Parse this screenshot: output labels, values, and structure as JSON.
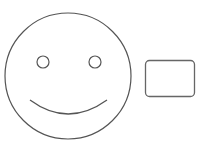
{
  "diagram": {
    "stroke_color": "#555555",
    "background": "#ffffff",
    "shapes": {
      "face": {
        "cx": 68,
        "cy": 76,
        "r": 63
      },
      "left_eye": {
        "cx": 43,
        "cy": 62,
        "r": 6
      },
      "right_eye": {
        "cx": 95,
        "cy": 62,
        "r": 6
      },
      "mouth": {
        "x1": 30,
        "y1": 100,
        "x2": 107,
        "y2": 100,
        "dip": 115
      },
      "rect": {
        "x": 145,
        "y": 60,
        "w": 50,
        "h": 37,
        "rx": 4
      }
    }
  }
}
